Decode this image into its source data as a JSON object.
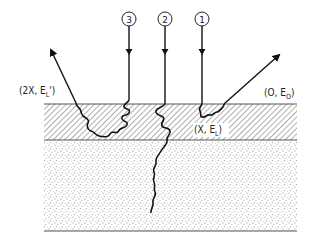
{
  "diagram": {
    "type": "particle-scattering-schematic",
    "regions": [
      {
        "id": "surface-layer",
        "fill": "diagonal-hatch"
      },
      {
        "id": "substrate",
        "fill": "stipple"
      }
    ],
    "beams": [
      {
        "id": "1",
        "label": "1",
        "x": 202
      },
      {
        "id": "2",
        "label": "2",
        "x": 165
      },
      {
        "id": "3",
        "label": "3",
        "x": 129
      }
    ],
    "labels": {
      "surface_exit": {
        "prefix": "(O, E",
        "sub": "O",
        "suffix": ")"
      },
      "layer_boundary": {
        "prefix": "(X, E",
        "sub": "L",
        "suffix": ")"
      },
      "double_pass_exit": {
        "prefix": "(2X, E",
        "sub": "L",
        "suffix": "')"
      }
    },
    "colors": {
      "ink": "#111111",
      "hatch": "#777777",
      "stipple": "#888888",
      "background": "#ffffff"
    }
  }
}
